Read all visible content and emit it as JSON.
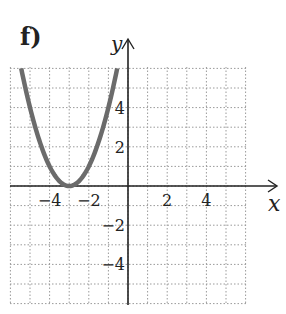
{
  "panel": {
    "label": "f)"
  },
  "chart_data": {
    "type": "line",
    "title": "",
    "xlabel": "x",
    "ylabel": "y",
    "xlim": [
      -6,
      6
    ],
    "ylim": [
      -6,
      6
    ],
    "grid": true,
    "x_ticks": [
      -4,
      -2,
      2,
      4
    ],
    "y_ticks": [
      4,
      2,
      -2,
      -4
    ],
    "x_tick_labels": [
      "−4",
      "−2",
      "2",
      "4"
    ],
    "y_tick_labels": [
      "4",
      "2",
      "−2",
      "−4"
    ],
    "series": [
      {
        "name": "y = (x + 3)^2",
        "color": "#6b6b6b",
        "x": [
          -5.45,
          -5,
          -4.5,
          -4,
          -3.5,
          -3,
          -2.5,
          -2,
          -1.5,
          -1,
          -0.55
        ],
        "y": [
          6.0,
          4.0,
          2.25,
          1.0,
          0.25,
          0.0,
          0.25,
          1.0,
          2.25,
          4.0,
          6.0
        ]
      }
    ],
    "vertex": {
      "x": -3,
      "y": 0
    }
  },
  "colors": {
    "axis": "#222222",
    "grid": "#9a9a9a",
    "curve": "#6b6b6b"
  }
}
